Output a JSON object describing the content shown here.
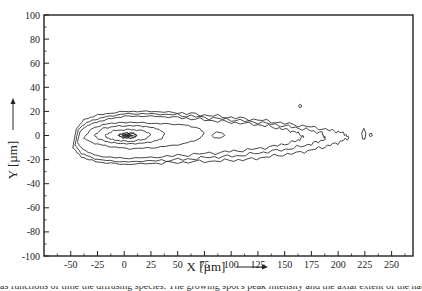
{
  "chart_data": {
    "type": "contour",
    "title": "",
    "xlabel": "X [µm]",
    "ylabel": "Y [µm]",
    "xlim": [
      -75,
      270
    ],
    "ylim": [
      -100,
      100
    ],
    "x_ticks": [
      -50,
      -25,
      0,
      25,
      50,
      75,
      100,
      125,
      150,
      175,
      200,
      225,
      250
    ],
    "y_ticks": [
      100,
      80,
      60,
      40,
      20,
      0,
      -20,
      -40,
      -60,
      -80,
      -100
    ],
    "x_tick_labels": [
      "-50",
      "-25",
      "0",
      "25",
      "50",
      "75",
      "100",
      "125",
      "150",
      "175",
      "200",
      "225",
      "250"
    ],
    "y_tick_labels": [
      "100",
      "80",
      "60",
      "40",
      "20",
      "0",
      "-20",
      "-40",
      "-60",
      "-80",
      "-100"
    ],
    "grid": false,
    "legend": null,
    "contours": [
      {
        "level": 1,
        "points": [
          [
            -48,
            -10
          ],
          [
            -45,
            5
          ],
          [
            -38,
            13
          ],
          [
            -25,
            17
          ],
          [
            0,
            20
          ],
          [
            25,
            20
          ],
          [
            50,
            19
          ],
          [
            75,
            17
          ],
          [
            100,
            15
          ],
          [
            125,
            13
          ],
          [
            150,
            10
          ],
          [
            175,
            7
          ],
          [
            195,
            4
          ],
          [
            205,
            2
          ],
          [
            210,
            -2
          ],
          [
            200,
            -6
          ],
          [
            185,
            -10
          ],
          [
            165,
            -14
          ],
          [
            140,
            -17
          ],
          [
            115,
            -20
          ],
          [
            90,
            -21
          ],
          [
            60,
            -22
          ],
          [
            30,
            -23
          ],
          [
            0,
            -24
          ],
          [
            -25,
            -22
          ],
          [
            -40,
            -18
          ],
          [
            -48,
            -10
          ]
        ]
      },
      {
        "level": 2,
        "points": [
          [
            -46,
            -8
          ],
          [
            -43,
            5
          ],
          [
            -35,
            11
          ],
          [
            -20,
            15
          ],
          [
            0,
            18
          ],
          [
            25,
            18
          ],
          [
            50,
            17
          ],
          [
            75,
            15
          ],
          [
            100,
            13
          ],
          [
            125,
            11
          ],
          [
            150,
            8
          ],
          [
            170,
            5
          ],
          [
            185,
            2
          ],
          [
            188,
            -3
          ],
          [
            175,
            -7
          ],
          [
            155,
            -11
          ],
          [
            130,
            -14
          ],
          [
            105,
            -17
          ],
          [
            80,
            -18
          ],
          [
            55,
            -20
          ],
          [
            25,
            -21
          ],
          [
            0,
            -22
          ],
          [
            -25,
            -20
          ],
          [
            -40,
            -15
          ],
          [
            -46,
            -8
          ]
        ]
      },
      {
        "level": 3,
        "points": [
          [
            -44,
            -6
          ],
          [
            -41,
            4
          ],
          [
            -33,
            9
          ],
          [
            -18,
            13
          ],
          [
            0,
            16
          ],
          [
            25,
            16
          ],
          [
            50,
            15
          ],
          [
            75,
            13
          ],
          [
            100,
            11
          ],
          [
            125,
            9
          ],
          [
            145,
            6
          ],
          [
            160,
            3
          ],
          [
            168,
            -1
          ],
          [
            160,
            -5
          ],
          [
            140,
            -9
          ],
          [
            115,
            -12
          ],
          [
            90,
            -14
          ],
          [
            60,
            -16
          ],
          [
            30,
            -18
          ],
          [
            0,
            -19
          ],
          [
            -25,
            -17
          ],
          [
            -38,
            -12
          ],
          [
            -44,
            -6
          ]
        ]
      },
      {
        "level": 4,
        "points": [
          [
            -38,
            -2
          ],
          [
            -30,
            6
          ],
          [
            -15,
            10
          ],
          [
            5,
            11
          ],
          [
            30,
            10
          ],
          [
            55,
            9
          ],
          [
            70,
            6
          ],
          [
            75,
            2
          ],
          [
            70,
            -3
          ],
          [
            55,
            -7
          ],
          [
            30,
            -10
          ],
          [
            5,
            -11
          ],
          [
            -15,
            -9
          ],
          [
            -30,
            -6
          ],
          [
            -38,
            -2
          ]
        ]
      },
      {
        "level": 5,
        "points": [
          [
            -28,
            0
          ],
          [
            -20,
            6
          ],
          [
            -5,
            8
          ],
          [
            15,
            8
          ],
          [
            30,
            6
          ],
          [
            38,
            2
          ],
          [
            35,
            -3
          ],
          [
            22,
            -6
          ],
          [
            5,
            -7
          ],
          [
            -12,
            -6
          ],
          [
            -24,
            -3
          ],
          [
            -28,
            0
          ]
        ]
      },
      {
        "level": 6,
        "points": [
          [
            -18,
            0
          ],
          [
            -10,
            4
          ],
          [
            5,
            5
          ],
          [
            18,
            4
          ],
          [
            25,
            1
          ],
          [
            20,
            -3
          ],
          [
            6,
            -5
          ],
          [
            -8,
            -4
          ],
          [
            -16,
            -2
          ],
          [
            -18,
            0
          ]
        ]
      },
      {
        "level": 7,
        "points": [
          [
            -6,
            0
          ],
          [
            0,
            2
          ],
          [
            8,
            2
          ],
          [
            12,
            0
          ],
          [
            8,
            -2
          ],
          [
            0,
            -2
          ],
          [
            -6,
            0
          ]
        ]
      },
      {
        "level": 8,
        "points": [
          [
            -2,
            0
          ],
          [
            3,
            1
          ],
          [
            8,
            0
          ],
          [
            3,
            -1
          ],
          [
            -2,
            0
          ]
        ]
      }
    ],
    "islands": [
      {
        "points": [
          [
            82,
            0
          ],
          [
            86,
            3
          ],
          [
            92,
            2
          ],
          [
            94,
            0
          ],
          [
            90,
            -2
          ],
          [
            84,
            -2
          ],
          [
            82,
            0
          ]
        ]
      },
      {
        "points": [
          [
            222,
            2
          ],
          [
            224,
            6
          ],
          [
            226,
            2
          ],
          [
            225,
            -3
          ],
          [
            223,
            -3
          ],
          [
            222,
            2
          ]
        ]
      },
      {
        "points": [
          [
            229,
            1
          ],
          [
            231,
            2
          ],
          [
            232,
            0
          ],
          [
            230,
            -1
          ],
          [
            229,
            1
          ]
        ]
      },
      {
        "points": [
          [
            163,
            25
          ],
          [
            165,
            26
          ],
          [
            166,
            24
          ],
          [
            164,
            23
          ],
          [
            163,
            25
          ]
        ]
      }
    ]
  },
  "caption_fragment": "as functions of time the diffusing species. The growing spot's peak intensity and the axial extent of the nat..."
}
